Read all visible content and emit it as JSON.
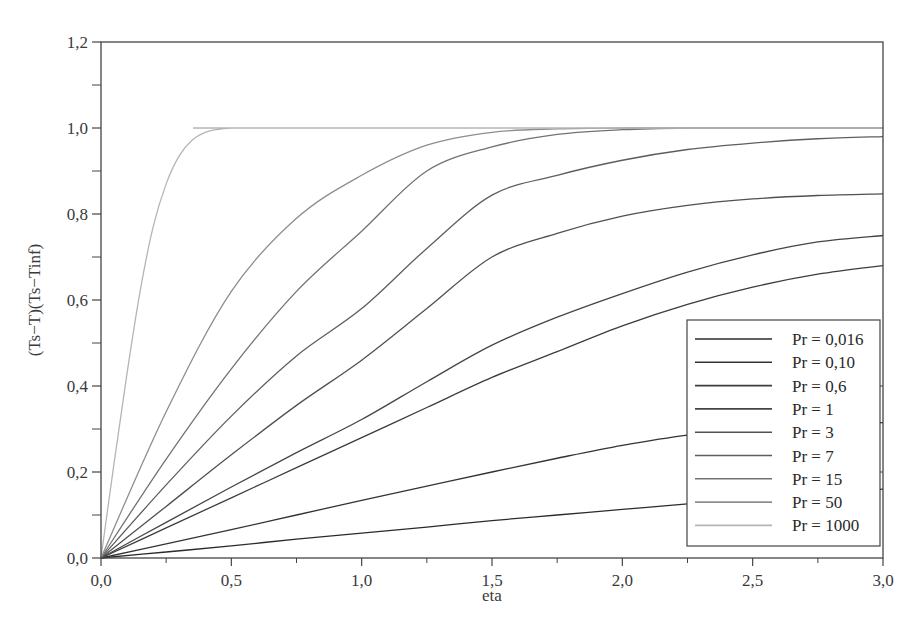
{
  "chart_data": {
    "type": "line",
    "title": "",
    "xlabel": "eta",
    "ylabel": "(Ts−T)(Ts−Tinf)",
    "xlim": [
      0,
      3.0
    ],
    "ylim": [
      0,
      1.2
    ],
    "grid": false,
    "legend_position": "lower right",
    "x_ticks": [
      0.0,
      0.5,
      1.0,
      1.5,
      2.0,
      2.5,
      3.0
    ],
    "x_tick_labels": [
      "0,0",
      "0,5",
      "1,0",
      "1,5",
      "2,0",
      "2,5",
      "3,0"
    ],
    "y_ticks": [
      0.0,
      0.2,
      0.4,
      0.6,
      0.8,
      1.0,
      1.2
    ],
    "y_tick_labels": [
      "0,0",
      "0,2",
      "0,4",
      "0,6",
      "0,8",
      "1,0",
      "1,2"
    ],
    "x": [
      0,
      0.25,
      0.5,
      0.75,
      1.0,
      1.25,
      1.5,
      1.75,
      2.0,
      2.25,
      2.5,
      2.75,
      3.0
    ],
    "series": [
      {
        "name": "Pr = 0,016",
        "color": "#2b2b2b",
        "values": [
          0,
          0.014,
          0.028,
          0.044,
          0.058,
          0.072,
          0.087,
          0.1,
          0.113,
          0.126,
          0.138,
          0.149,
          0.16
        ]
      },
      {
        "name": "Pr = 0,10",
        "color": "#333333",
        "values": [
          0,
          0.033,
          0.066,
          0.1,
          0.134,
          0.167,
          0.2,
          0.232,
          0.262,
          0.286,
          0.3,
          0.31,
          0.315
        ]
      },
      {
        "name": "Pr = 0,6",
        "color": "#3c3c3c",
        "values": [
          0,
          0.07,
          0.14,
          0.21,
          0.28,
          0.35,
          0.42,
          0.48,
          0.54,
          0.59,
          0.63,
          0.66,
          0.68
        ]
      },
      {
        "name": "Pr = 1",
        "color": "#454545",
        "values": [
          0,
          0.083,
          0.165,
          0.245,
          0.322,
          0.41,
          0.495,
          0.56,
          0.615,
          0.665,
          0.705,
          0.735,
          0.75
        ]
      },
      {
        "name": "Pr = 3",
        "color": "#505050",
        "values": [
          0,
          0.12,
          0.24,
          0.355,
          0.46,
          0.58,
          0.7,
          0.755,
          0.795,
          0.82,
          0.835,
          0.843,
          0.847
        ]
      },
      {
        "name": "Pr = 7",
        "color": "#5e5e5e",
        "values": [
          0,
          0.17,
          0.33,
          0.47,
          0.58,
          0.72,
          0.844,
          0.89,
          0.925,
          0.95,
          0.965,
          0.975,
          0.98
        ]
      },
      {
        "name": "Pr = 15",
        "color": "#727272",
        "values": [
          0,
          0.23,
          0.44,
          0.62,
          0.76,
          0.9,
          0.956,
          0.985,
          0.996,
          1.0,
          1.0,
          1.0,
          1.0
        ]
      },
      {
        "name": "Pr = 50",
        "color": "#8e8e8e",
        "values": [
          0,
          0.34,
          0.62,
          0.79,
          0.89,
          0.96,
          0.99,
          0.998,
          1.0,
          1.0,
          1.0,
          1.0,
          1.0
        ]
      },
      {
        "name": "Pr = 1000",
        "color": "#b5b5b5",
        "values": [
          0,
          0.87,
          1.0,
          1.0,
          1.0,
          1.0,
          1.0,
          1.0,
          1.0,
          1.0,
          1.0,
          1.0,
          1.0
        ]
      }
    ],
    "pr1000_fine": {
      "x": [
        0,
        0.05,
        0.1,
        0.15,
        0.2,
        0.25,
        0.3,
        0.35,
        0.4,
        0.45,
        0.5,
        0.55,
        3.0
      ],
      "values": [
        0,
        0.22,
        0.43,
        0.62,
        0.77,
        0.87,
        0.935,
        0.972,
        0.99,
        0.997,
        1.0,
        1.0,
        1.0
      ]
    }
  },
  "legend": {
    "items": [
      "Pr = 0,016",
      "Pr = 0,10",
      "Pr = 0,6",
      "Pr = 1",
      "Pr = 3",
      "Pr = 7",
      "Pr = 15",
      "Pr = 50",
      "Pr = 1000"
    ]
  },
  "axes": {
    "x_title": "eta",
    "y_title": "(Ts−T)(Ts−Tinf)"
  }
}
